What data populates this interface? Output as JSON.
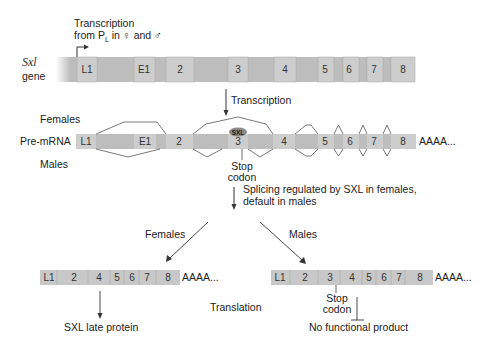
{
  "gene": {
    "label_italic": "Sxl",
    "label": "gene",
    "promoter_text_line1": "Transcription",
    "promoter_text_line2_prefix": "from P",
    "promoter_sub": "L",
    "promoter_text_line2_suffix": " in ♀ and ♂",
    "exons": [
      "L1",
      "E1",
      "2",
      "3",
      "4",
      "5",
      "6",
      "7",
      "8"
    ]
  },
  "transcription_arrow_label": "Transcription",
  "pre_mrna": {
    "label": "Pre-mRNA",
    "females_label": "Females",
    "males_label": "Males",
    "exons": [
      "L1",
      "E1",
      "2",
      "3",
      "4",
      "5",
      "6",
      "7",
      "8"
    ],
    "polyA": "AAAA...",
    "sxl_badge": "SXL",
    "stop_line1": "Stop",
    "stop_line2": "codon"
  },
  "splicing_arrow_label_line1": "Splicing regulated by SXL in females,",
  "splicing_arrow_label_line2": "default in males",
  "female_branch": {
    "label": "Females",
    "mrna_exons": [
      "L1",
      "2",
      "4",
      "5",
      "6",
      "7",
      "8"
    ],
    "polyA": "AAAA...",
    "product": "SXL late protein"
  },
  "male_branch": {
    "label": "Males",
    "mrna_exons": [
      "L1",
      "2",
      "3",
      "4",
      "5",
      "6",
      "7",
      "8"
    ],
    "polyA": "AAAA...",
    "stop_line1": "Stop",
    "stop_line2": "codon",
    "product": "No functional product"
  },
  "translation_label": "Translation",
  "colors": {
    "exon_fill": "#c8c8c8",
    "intron_fill": "#b8b8b8",
    "line": "#444444",
    "sxl_badge": "#8a8a8a"
  }
}
